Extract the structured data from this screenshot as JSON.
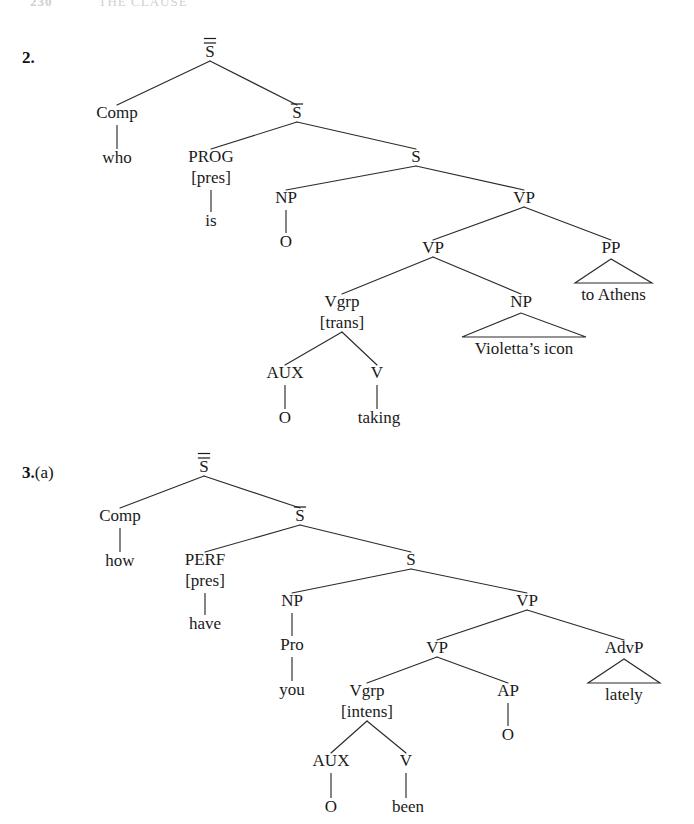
{
  "page": {
    "width": 694,
    "height": 824,
    "background": "#ffffff",
    "ink": "#1a1a1a"
  },
  "running_head": {
    "folio": "230",
    "title": "THE CLAUSE",
    "color": "#cfcfd4"
  },
  "exercises": [
    {
      "id": "ex2",
      "label_number": "2.",
      "label_suffix": "",
      "label_x": 22,
      "label_y": 62,
      "tree": {
        "name": "tree-2",
        "sentence_gloss": "who is O taking Violetta's icon to Athens",
        "nodes": [
          {
            "id": "n1",
            "label": "S",
            "bars": 2,
            "x": 210,
            "y": 57,
            "name": "node-s-double-bar"
          },
          {
            "id": "n2",
            "label": "Comp",
            "bars": 0,
            "x": 117,
            "y": 118,
            "name": "node-comp"
          },
          {
            "id": "n3",
            "label": "who",
            "bars": 0,
            "x": 117,
            "y": 163,
            "name": "terminal-who",
            "terminal": true
          },
          {
            "id": "n4",
            "label": "S",
            "bars": 1,
            "x": 297,
            "y": 118,
            "name": "node-s-single-bar"
          },
          {
            "id": "n5",
            "label": "PROG",
            "bars": 0,
            "x": 211,
            "y": 162,
            "sub": "[pres]",
            "name": "node-prog"
          },
          {
            "id": "n6",
            "label": "is",
            "bars": 0,
            "x": 211,
            "y": 226,
            "name": "terminal-is",
            "terminal": true
          },
          {
            "id": "n7",
            "label": "S",
            "bars": 0,
            "x": 416,
            "y": 162,
            "name": "node-s-plain"
          },
          {
            "id": "n8",
            "label": "NP",
            "bars": 0,
            "x": 286,
            "y": 203,
            "name": "node-np-subject"
          },
          {
            "id": "n9",
            "label": "O",
            "bars": 0,
            "x": 286,
            "y": 247,
            "name": "terminal-o-subject",
            "terminal": true
          },
          {
            "id": "n10",
            "label": "VP",
            "bars": 0,
            "x": 524,
            "y": 203,
            "name": "node-vp-top"
          },
          {
            "id": "n11",
            "label": "VP",
            "bars": 0,
            "x": 433,
            "y": 253,
            "name": "node-vp-inner"
          },
          {
            "id": "n12",
            "label": "PP",
            "bars": 0,
            "x": 611,
            "y": 253,
            "name": "node-pp"
          },
          {
            "id": "n13",
            "label": "Vgrp",
            "bars": 0,
            "x": 342,
            "y": 307,
            "sub": "[trans]",
            "name": "node-vgrp"
          },
          {
            "id": "n14",
            "label": "NP",
            "bars": 0,
            "x": 521,
            "y": 307,
            "name": "node-np-object"
          },
          {
            "id": "n15",
            "label": "AUX",
            "bars": 0,
            "x": 285,
            "y": 378,
            "name": "node-aux"
          },
          {
            "id": "n16",
            "label": "V",
            "bars": 0,
            "x": 377,
            "y": 378,
            "name": "node-v"
          },
          {
            "id": "n17",
            "label": "O",
            "bars": 0,
            "x": 285,
            "y": 423,
            "name": "terminal-o-aux",
            "terminal": true
          },
          {
            "id": "n18",
            "label": "taking",
            "bars": 0,
            "x": 379,
            "y": 423,
            "name": "terminal-taking",
            "terminal": true
          }
        ],
        "edges": [
          {
            "from": "n1",
            "to": "n2"
          },
          {
            "from": "n1",
            "to": "n4"
          },
          {
            "from": "n4",
            "to": "n5"
          },
          {
            "from": "n4",
            "to": "n7"
          },
          {
            "from": "n7",
            "to": "n8"
          },
          {
            "from": "n7",
            "to": "n10"
          },
          {
            "from": "n10",
            "to": "n11"
          },
          {
            "from": "n10",
            "to": "n12"
          },
          {
            "from": "n11",
            "to": "n13"
          },
          {
            "from": "n11",
            "to": "n14"
          },
          {
            "from": "n13",
            "to": "n15"
          },
          {
            "from": "n13",
            "to": "n16"
          }
        ],
        "stems": [
          {
            "from": "n2",
            "to": "n3"
          },
          {
            "from": "n5",
            "to": "n6"
          },
          {
            "from": "n8",
            "to": "n9"
          },
          {
            "from": "n15",
            "to": "n17"
          },
          {
            "from": "n16",
            "to": "n18"
          }
        ],
        "triangles": [
          {
            "parent": "n12",
            "text": "to Athens",
            "left": 575,
            "right": 652,
            "base_y": 283,
            "text_y": 300,
            "name": "triangle-to-athens"
          },
          {
            "parent": "n14",
            "text": "Violetta’s icon",
            "left": 462,
            "right": 586,
            "base_y": 337,
            "text_y": 354,
            "name": "triangle-violettas-icon"
          }
        ]
      }
    },
    {
      "id": "ex3a",
      "label_number": "3.",
      "label_suffix": "(a)",
      "label_x": 22,
      "label_y": 477,
      "tree": {
        "name": "tree-3a",
        "sentence_gloss": "how have you O been O lately",
        "nodes": [
          {
            "id": "m1",
            "label": "S",
            "bars": 2,
            "x": 204,
            "y": 472,
            "name": "node-s-double-bar"
          },
          {
            "id": "m2",
            "label": "Comp",
            "bars": 0,
            "x": 120,
            "y": 521,
            "name": "node-comp"
          },
          {
            "id": "m3",
            "label": "how",
            "bars": 0,
            "x": 120,
            "y": 566,
            "name": "terminal-how",
            "terminal": true
          },
          {
            "id": "m4",
            "label": "S",
            "bars": 1,
            "x": 300,
            "y": 521,
            "name": "node-s-single-bar"
          },
          {
            "id": "m5",
            "label": "PERF",
            "bars": 0,
            "x": 205,
            "y": 565,
            "sub": "[pres]",
            "name": "node-perf"
          },
          {
            "id": "m6",
            "label": "have",
            "bars": 0,
            "x": 205,
            "y": 629,
            "name": "terminal-have",
            "terminal": true
          },
          {
            "id": "m7",
            "label": "S",
            "bars": 0,
            "x": 411,
            "y": 565,
            "name": "node-s-plain"
          },
          {
            "id": "m8",
            "label": "NP",
            "bars": 0,
            "x": 292,
            "y": 606,
            "name": "node-np-subject"
          },
          {
            "id": "m9",
            "label": "Pro",
            "bars": 0,
            "x": 292,
            "y": 650,
            "name": "node-pro"
          },
          {
            "id": "m10",
            "label": "you",
            "bars": 0,
            "x": 292,
            "y": 695,
            "name": "terminal-you",
            "terminal": true
          },
          {
            "id": "m11",
            "label": "VP",
            "bars": 0,
            "x": 527,
            "y": 606,
            "name": "node-vp-top"
          },
          {
            "id": "m12",
            "label": "VP",
            "bars": 0,
            "x": 437,
            "y": 653,
            "name": "node-vp-inner"
          },
          {
            "id": "m13",
            "label": "AdvP",
            "bars": 0,
            "x": 624,
            "y": 653,
            "name": "node-advp"
          },
          {
            "id": "m14",
            "label": "Vgrp",
            "bars": 0,
            "x": 367,
            "y": 696,
            "sub": "[intens]",
            "name": "node-vgrp"
          },
          {
            "id": "m15",
            "label": "AP",
            "bars": 0,
            "x": 508,
            "y": 696,
            "name": "node-ap"
          },
          {
            "id": "m16",
            "label": "O",
            "bars": 0,
            "x": 508,
            "y": 740,
            "name": "terminal-o-ap",
            "terminal": true
          },
          {
            "id": "m17",
            "label": "AUX",
            "bars": 0,
            "x": 331,
            "y": 766,
            "name": "node-aux"
          },
          {
            "id": "m18",
            "label": "V",
            "bars": 0,
            "x": 406,
            "y": 766,
            "name": "node-v"
          },
          {
            "id": "m19",
            "label": "O",
            "bars": 0,
            "x": 331,
            "y": 812,
            "name": "terminal-o-aux",
            "terminal": true
          },
          {
            "id": "m20",
            "label": "been",
            "bars": 0,
            "x": 408,
            "y": 812,
            "name": "terminal-been",
            "terminal": true
          }
        ],
        "edges": [
          {
            "from": "m1",
            "to": "m2"
          },
          {
            "from": "m1",
            "to": "m4"
          },
          {
            "from": "m4",
            "to": "m5"
          },
          {
            "from": "m4",
            "to": "m7"
          },
          {
            "from": "m7",
            "to": "m8"
          },
          {
            "from": "m7",
            "to": "m11"
          },
          {
            "from": "m11",
            "to": "m12"
          },
          {
            "from": "m11",
            "to": "m13"
          },
          {
            "from": "m12",
            "to": "m14"
          },
          {
            "from": "m12",
            "to": "m15"
          },
          {
            "from": "m14",
            "to": "m17"
          },
          {
            "from": "m14",
            "to": "m18"
          }
        ],
        "stems": [
          {
            "from": "m2",
            "to": "m3"
          },
          {
            "from": "m5",
            "to": "m6"
          },
          {
            "from": "m8",
            "to": "m9"
          },
          {
            "from": "m9",
            "to": "m10"
          },
          {
            "from": "m15",
            "to": "m16"
          },
          {
            "from": "m17",
            "to": "m19"
          },
          {
            "from": "m18",
            "to": "m20"
          }
        ],
        "triangles": [
          {
            "parent": "m13",
            "text": "lately",
            "left": 588,
            "right": 660,
            "base_y": 683,
            "text_y": 700,
            "name": "triangle-lately"
          }
        ]
      }
    }
  ]
}
